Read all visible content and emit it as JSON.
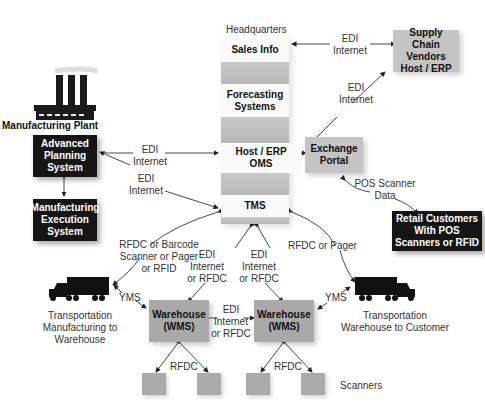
{
  "headquarters": {
    "title": "Headquarters",
    "cells": [
      "Sales Info",
      "Forecasting Systems",
      "Host / ERP OMS",
      "TMS"
    ]
  },
  "nodes": {
    "supply_chain": "Supply Chain Vendors Host / ERP",
    "exchange_portal": "Exchange Portal",
    "manufacturing_plant": "Manufacturing Plant",
    "advanced_planning": "Advanced Planning System",
    "manufacturing_execution": "Manufacturing Execution System",
    "retail_customers": "Retail Customers With POS Scanners or RFID",
    "warehouse_left": "Warehouse (WMS)",
    "warehouse_right": "Warehouse (WMS)",
    "scanners": "Scanners"
  },
  "transport": {
    "left": "Transportation Manufacturing to Warehouse",
    "right": "Transportation Warehouse to Customer"
  },
  "connections": {
    "sales_supply": "EDI Internet",
    "exchange_supply": "EDI Internet",
    "aps_oms": "EDI Internet",
    "aps_tms": "EDI Internet",
    "exchange_retail": "POS Scanner Data",
    "tms_truck_left": "RFDC or Barcode Scanner or Pager or RFID",
    "tms_truck_right": "RFDC or Pager",
    "tms_wh_left": "EDI Internet or RFDC",
    "tms_wh_right": "EDI Internet or RFDC",
    "wh_wh": "EDI Internet or RFDC",
    "yms_left": "YMS",
    "yms_right": "YMS",
    "rfdc_left": "RFDC",
    "rfdc_right": "RFDC"
  },
  "colors": {
    "dark_box": "#151515",
    "grey_box": "#c4c4c4",
    "wms_box": "#a9a9a9",
    "scanner_box": "#aaaaaa"
  }
}
